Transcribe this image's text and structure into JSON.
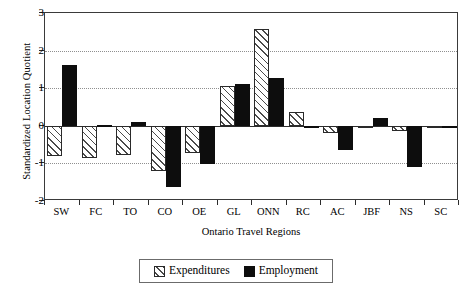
{
  "chart_data": {
    "type": "bar",
    "title": "",
    "xlabel": "Ontario Travel Regions",
    "ylabel": "Standardized Location Quotient",
    "categories": [
      "SW",
      "FC",
      "TO",
      "CO",
      "OE",
      "GL",
      "ONN",
      "RC",
      "AC",
      "JBF",
      "NS",
      "SC"
    ],
    "series": [
      {
        "name": "Expenditures",
        "color": "#ffffff",
        "pattern": "diagonal-hatch",
        "values": [
          -0.8,
          -0.86,
          -0.78,
          -1.2,
          -0.72,
          1.06,
          2.57,
          0.37,
          -0.18,
          -0.06,
          -0.14,
          -0.04
        ]
      },
      {
        "name": "Employment",
        "color": "#0d0d0d",
        "pattern": "solid",
        "values": [
          1.62,
          0.02,
          0.1,
          -1.63,
          -1.02,
          1.11,
          1.27,
          0.0,
          -0.65,
          0.22,
          -1.1,
          -0.04
        ]
      }
    ],
    "ylim": [
      -2,
      3
    ],
    "yticks": [
      3,
      2,
      1,
      0,
      -1,
      -2
    ],
    "ytick_labels": [
      "3",
      "2",
      "1",
      "0",
      "-1",
      "-2"
    ],
    "grid": true,
    "grid_axis": "y",
    "legend_position": "bottom-center",
    "legend_entries": [
      "Expenditures",
      "Employment"
    ]
  }
}
